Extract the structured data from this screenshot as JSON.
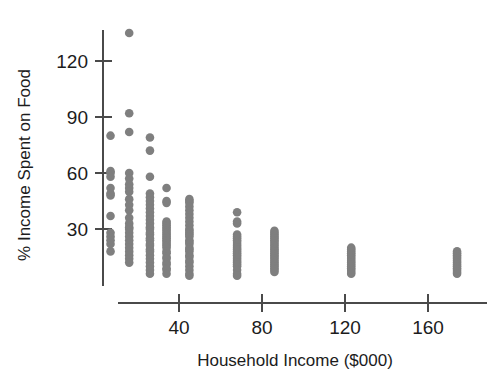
{
  "chart_data": {
    "type": "scatter",
    "title": "",
    "xlabel": "Household Income ($000)",
    "ylabel": "% Income Spent on Food",
    "xlim": [
      0,
      190
    ],
    "ylim": [
      0,
      142
    ],
    "xticks": [
      40,
      80,
      120,
      160
    ],
    "xtick_labels": [
      "40",
      "80",
      "120",
      "160"
    ],
    "yticks": [
      30,
      60,
      90,
      120
    ],
    "ytick_labels": [
      "30",
      "60",
      "90",
      "120"
    ],
    "grid": false,
    "legend": "none",
    "marker_color": "#7f7f7f",
    "marker_size": 7,
    "axis_color": "#4a4a4a",
    "columns": [
      {
        "x": 7,
        "values": [
          80,
          61,
          60,
          58,
          52,
          49,
          48,
          37,
          28,
          26,
          24,
          22,
          18
        ]
      },
      {
        "x": 16,
        "values": [
          135,
          92,
          82,
          60,
          57,
          54,
          52,
          50,
          46,
          43,
          40,
          36,
          33,
          31,
          30,
          28,
          26,
          24,
          22,
          20,
          18,
          16,
          14,
          12
        ]
      },
      {
        "x": 26,
        "values": [
          79,
          72,
          58,
          49,
          47,
          45,
          43,
          41,
          39,
          37,
          35,
          33,
          31,
          30,
          28,
          27,
          25,
          24,
          22,
          21,
          19,
          18,
          16,
          14,
          12,
          10,
          8,
          6
        ]
      },
      {
        "x": 34,
        "values": [
          52,
          45,
          44,
          34,
          33,
          32,
          31,
          30,
          29,
          28,
          27,
          26,
          25,
          24,
          23,
          22,
          21,
          20,
          18,
          17,
          15,
          14,
          12,
          11,
          9,
          8,
          6
        ]
      },
      {
        "x": 45,
        "values": [
          46,
          45,
          44,
          42,
          40,
          38,
          36,
          34,
          32,
          30,
          29,
          28,
          27,
          26,
          24,
          23,
          22,
          20,
          19,
          18,
          16,
          15,
          13,
          12,
          10,
          8,
          6,
          5
        ]
      },
      {
        "x": 68,
        "values": [
          39,
          34,
          33,
          27,
          26,
          25,
          24,
          23,
          22,
          21,
          20,
          19,
          18,
          17,
          16,
          15,
          14,
          13,
          12,
          11,
          10,
          8,
          6,
          5
        ]
      },
      {
        "x": 86,
        "values": [
          29,
          28,
          27,
          26,
          25,
          24,
          23,
          22,
          21,
          20,
          19,
          18,
          17,
          16,
          15,
          14,
          13,
          12,
          11,
          10,
          9,
          8,
          7
        ]
      },
      {
        "x": 123,
        "values": [
          20,
          19,
          18,
          17,
          16,
          15,
          14,
          13,
          12,
          11,
          10,
          9,
          8,
          7,
          6
        ]
      },
      {
        "x": 174,
        "values": [
          18,
          17,
          16,
          15,
          14,
          13,
          12,
          11,
          10,
          9,
          8,
          7,
          6
        ]
      }
    ]
  }
}
